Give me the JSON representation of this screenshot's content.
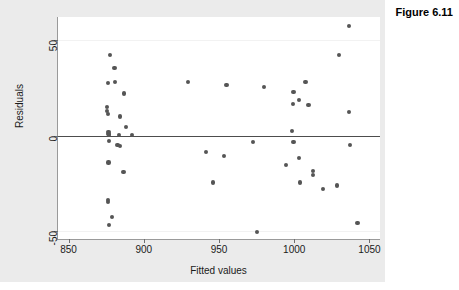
{
  "figure": {
    "title": "Figure 6.11"
  },
  "chart_data": {
    "type": "scatter",
    "title": "Figure 6.11",
    "xlabel": "Fitted values",
    "ylabel": "Residuals",
    "xlim": [
      843,
      1057
    ],
    "ylim": [
      -54,
      62
    ],
    "xticks": [
      850,
      900,
      950,
      1000,
      1050
    ],
    "yticks": [
      50,
      0,
      -50
    ],
    "grid": true,
    "gridlines_y": [
      50,
      -50
    ],
    "reference_line": {
      "y": 0,
      "color": "#4d4d4d"
    },
    "legend": null,
    "marker": {
      "shape": "circle",
      "color": "#555555",
      "size": 4
    },
    "points": [
      {
        "x": 877.5,
        "y": 42.0
      },
      {
        "x": 880.5,
        "y": 35.5
      },
      {
        "x": 876.0,
        "y": 27.5
      },
      {
        "x": 881.0,
        "y": 28.0
      },
      {
        "x": 887.0,
        "y": 22.0
      },
      {
        "x": 875.5,
        "y": 15.0
      },
      {
        "x": 875.5,
        "y": 13.0
      },
      {
        "x": 876.0,
        "y": 11.5
      },
      {
        "x": 884.0,
        "y": 10.0
      },
      {
        "x": 876.5,
        "y": 2.0
      },
      {
        "x": 876.5,
        "y": 1.0
      },
      {
        "x": 877.0,
        "y": 0.5
      },
      {
        "x": 883.5,
        "y": 0.5
      },
      {
        "x": 888.0,
        "y": 4.5
      },
      {
        "x": 892.0,
        "y": 0.5
      },
      {
        "x": 877.0,
        "y": -3.0
      },
      {
        "x": 882.5,
        "y": -5.0
      },
      {
        "x": 884.0,
        "y": -5.5
      },
      {
        "x": 876.5,
        "y": -14.0
      },
      {
        "x": 886.5,
        "y": -19.0
      },
      {
        "x": 876.0,
        "y": -33.5
      },
      {
        "x": 876.0,
        "y": -34.5
      },
      {
        "x": 879.0,
        "y": -42.5
      },
      {
        "x": 877.0,
        "y": -46.5
      },
      {
        "x": 929.5,
        "y": 28.0
      },
      {
        "x": 955.0,
        "y": 26.5
      },
      {
        "x": 941.5,
        "y": -8.5
      },
      {
        "x": 953.5,
        "y": -10.5
      },
      {
        "x": 946.0,
        "y": -24.5
      },
      {
        "x": 975.5,
        "y": -50.5
      },
      {
        "x": 972.5,
        "y": -3.5
      },
      {
        "x": 980.0,
        "y": 25.5
      },
      {
        "x": 999.5,
        "y": 23.0
      },
      {
        "x": 1003.0,
        "y": 18.5
      },
      {
        "x": 999.0,
        "y": 16.5
      },
      {
        "x": 1007.5,
        "y": 28.0
      },
      {
        "x": 1009.5,
        "y": 16.0
      },
      {
        "x": 998.5,
        "y": 2.5
      },
      {
        "x": 999.5,
        "y": -3.5
      },
      {
        "x": 1003.0,
        "y": -11.5
      },
      {
        "x": 994.5,
        "y": -15.5
      },
      {
        "x": 1012.5,
        "y": -18.5
      },
      {
        "x": 1012.5,
        "y": -20.5
      },
      {
        "x": 1004.0,
        "y": -24.5
      },
      {
        "x": 1019.0,
        "y": -28.0
      },
      {
        "x": 1028.5,
        "y": -26.0
      },
      {
        "x": 1029.5,
        "y": 42.0
      },
      {
        "x": 1036.5,
        "y": 57.5
      },
      {
        "x": 1036.5,
        "y": 12.5
      },
      {
        "x": 1037.0,
        "y": -5.0
      },
      {
        "x": 1042.0,
        "y": -45.5
      }
    ]
  }
}
